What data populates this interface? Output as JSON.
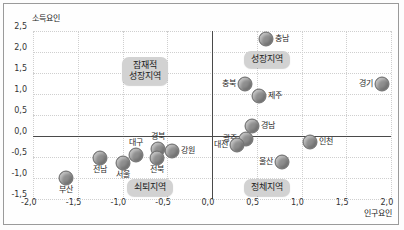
{
  "chart_data": {
    "type": "scatter",
    "title": "",
    "xlabel": "인구요인",
    "ylabel": "소득요인",
    "xlim": [
      -2.0,
      2.0
    ],
    "ylim": [
      -1.5,
      2.5
    ],
    "xticks": [
      "-2,0",
      "-1,5",
      "-1,0",
      "-0,5",
      "0,0",
      "0,5",
      "1,0",
      "1,5",
      "2,0"
    ],
    "yticks": [
      "2,5",
      "2,0",
      "1,5",
      "1,0",
      "0,5",
      "0,0",
      "-0,5",
      "-1,0",
      "-1,5"
    ],
    "grid": true,
    "legend": "none",
    "point_color": "#8e8e8e",
    "points": [
      {
        "label": "충남",
        "x": 0.6,
        "y": 2.3,
        "lpos": "right"
      },
      {
        "label": "경기",
        "x": 1.9,
        "y": 1.25,
        "lpos": "left"
      },
      {
        "label": "충북",
        "x": 0.37,
        "y": 1.25,
        "lpos": "left"
      },
      {
        "label": "제주",
        "x": 0.52,
        "y": 0.95,
        "lpos": "right"
      },
      {
        "label": "경남",
        "x": 0.45,
        "y": 0.25,
        "lpos": "right"
      },
      {
        "label": "광주",
        "x": 0.38,
        "y": -0.07,
        "lpos": "left"
      },
      {
        "label": "대전",
        "x": 0.28,
        "y": -0.22,
        "lpos": "left"
      },
      {
        "label": "인천",
        "x": 1.1,
        "y": -0.15,
        "lpos": "right"
      },
      {
        "label": "울산",
        "x": 0.78,
        "y": -0.62,
        "lpos": "left"
      },
      {
        "label": "강원",
        "x": -0.45,
        "y": -0.35,
        "lpos": "right"
      },
      {
        "label": "경북",
        "x": -0.6,
        "y": -0.3,
        "lpos": "top"
      },
      {
        "label": "대구",
        "x": -0.85,
        "y": -0.45,
        "lpos": "top"
      },
      {
        "label": "전북",
        "x": -0.62,
        "y": -0.52,
        "lpos": "bottom"
      },
      {
        "label": "전남",
        "x": -1.25,
        "y": -0.52,
        "lpos": "bottom"
      },
      {
        "label": "서울",
        "x": -1.0,
        "y": -0.65,
        "lpos": "bottom"
      },
      {
        "label": "부산",
        "x": -1.63,
        "y": -1.0,
        "lpos": "bottom"
      }
    ],
    "zones": [
      {
        "name": "potential-growth",
        "text": "잠재적\n성장지역",
        "x": -0.75,
        "y": 1.55
      },
      {
        "name": "growth",
        "text": "성장지역",
        "x": 0.62,
        "y": 1.82
      },
      {
        "name": "decline",
        "text": "쇠퇴지역",
        "x": -0.69,
        "y": -1.22
      },
      {
        "name": "stagnation",
        "text": "정체지역",
        "x": 0.62,
        "y": -1.22
      }
    ]
  }
}
